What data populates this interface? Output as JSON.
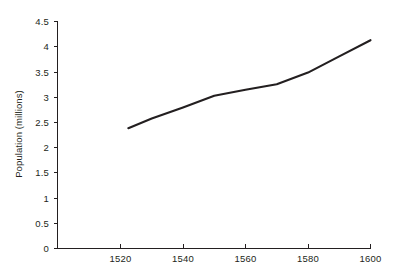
{
  "chart_data": {
    "type": "line",
    "title": "",
    "subtitle": "",
    "xlabel": "",
    "ylabel": "Population (millions)",
    "xlim": [
      1500,
      1600
    ],
    "ylim": [
      0,
      4.5
    ],
    "xticks": [
      1520,
      1540,
      1560,
      1580,
      1600
    ],
    "xticklabels": [
      "1520",
      "1540",
      "1560",
      "1580",
      "1600"
    ],
    "yticks": [
      0,
      0.5,
      1,
      1.5,
      2,
      2.5,
      3,
      3.5,
      4,
      4.5
    ],
    "yticklabels": [
      "0",
      "0.5",
      "1",
      "1.5",
      "2",
      "2.5",
      "3",
      "3.5",
      "4",
      "4.5"
    ],
    "grid": false,
    "legend": false,
    "legend_position": "none",
    "line_color": "#231f20",
    "background_color": "#ffffff",
    "series": [
      {
        "name": "Population",
        "x": [
          1522.5,
          1530,
          1540,
          1550,
          1560,
          1570,
          1580,
          1590,
          1600
        ],
        "values": [
          2.38,
          2.57,
          2.79,
          3.02,
          3.14,
          3.25,
          3.48,
          3.8,
          4.12
        ]
      }
    ],
    "annotations": []
  }
}
